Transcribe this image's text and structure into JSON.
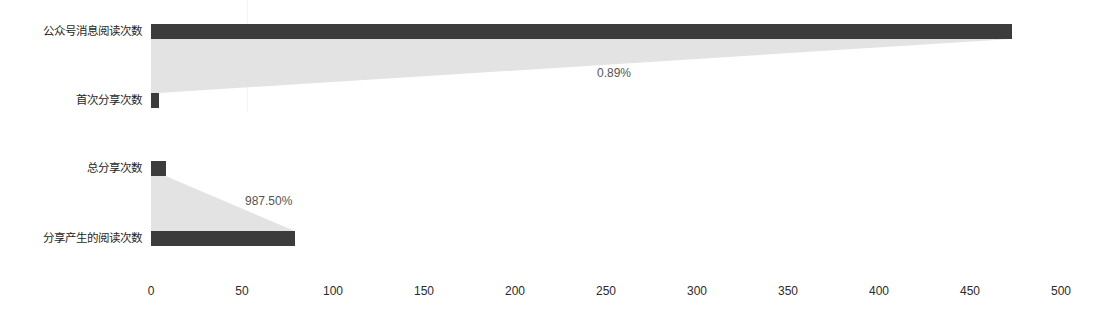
{
  "chart_data": {
    "type": "bar",
    "subtype": "funnel-conversion",
    "title": "",
    "xlabel": "",
    "ylabel": "",
    "xlim": [
      0,
      500
    ],
    "grid": false,
    "legend": null,
    "xticks": [
      {
        "label": "0",
        "value": 0
      },
      {
        "label": "50",
        "value": 50
      },
      {
        "label": "100",
        "value": 100
      },
      {
        "label": "150",
        "value": 150
      },
      {
        "label": "200",
        "value": 200
      },
      {
        "label": "250",
        "value": 250
      },
      {
        "label": "300",
        "value": 300
      },
      {
        "label": "350",
        "value": 350
      },
      {
        "label": "400",
        "value": 400
      },
      {
        "label": "450",
        "value": 450
      },
      {
        "label": "500",
        "value": 500
      }
    ],
    "groups": [
      {
        "name": "group-1",
        "categories": [
          "公众号消息阅读次数",
          "首次分享次数"
        ],
        "values": [
          473,
          4.2
        ],
        "rate_label": "0.89%",
        "rate_value": 0.89
      },
      {
        "name": "group-2",
        "categories": [
          "总分享次数",
          "分享产生的阅读次数"
        ],
        "values": [
          8,
          79
        ],
        "rate_label": "987.50%",
        "rate_value": 987.5
      }
    ],
    "colors": {
      "bar": "#3c3c3c",
      "funnel": "#e3e3e3",
      "tick_text": "#2b2b2b",
      "category_text": "#1f1f1f",
      "rate_text": "#555555",
      "background": "#ffffff"
    }
  },
  "labels": {
    "cat_0": "公众号消息阅读次数",
    "cat_1": "首次分享次数",
    "cat_2": "总分享次数",
    "cat_3": "分享产生的阅读次数",
    "rate_0": "0.89%",
    "rate_1": "987.50%"
  },
  "xticks": {
    "t0": "0",
    "t1": "50",
    "t2": "100",
    "t3": "150",
    "t4": "200",
    "t5": "250",
    "t6": "300",
    "t7": "350",
    "t8": "400",
    "t9": "450",
    "t10": "500"
  }
}
